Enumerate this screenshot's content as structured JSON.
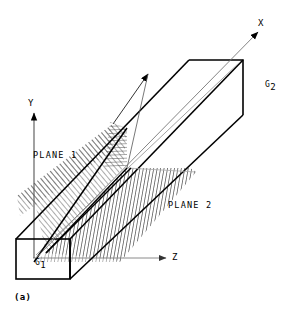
{
  "figure": {
    "caption": "(a)",
    "axes": [
      {
        "name": "x-axis",
        "label": "X"
      },
      {
        "name": "y-axis",
        "label": "Y"
      },
      {
        "name": "z-axis",
        "label": "Z"
      }
    ],
    "planes": [
      {
        "name": "plane-1",
        "label": "PLANE 1"
      },
      {
        "name": "plane-2",
        "label": "PLANE 2"
      }
    ],
    "points": [
      {
        "name": "g1",
        "label": "G",
        "sub": "1"
      },
      {
        "name": "g2",
        "label": "G",
        "sub": "2"
      }
    ],
    "colors": {
      "stroke": "#000000",
      "thin_stroke": "#808080",
      "hatch": "#555555",
      "background": "#ffffff"
    }
  }
}
